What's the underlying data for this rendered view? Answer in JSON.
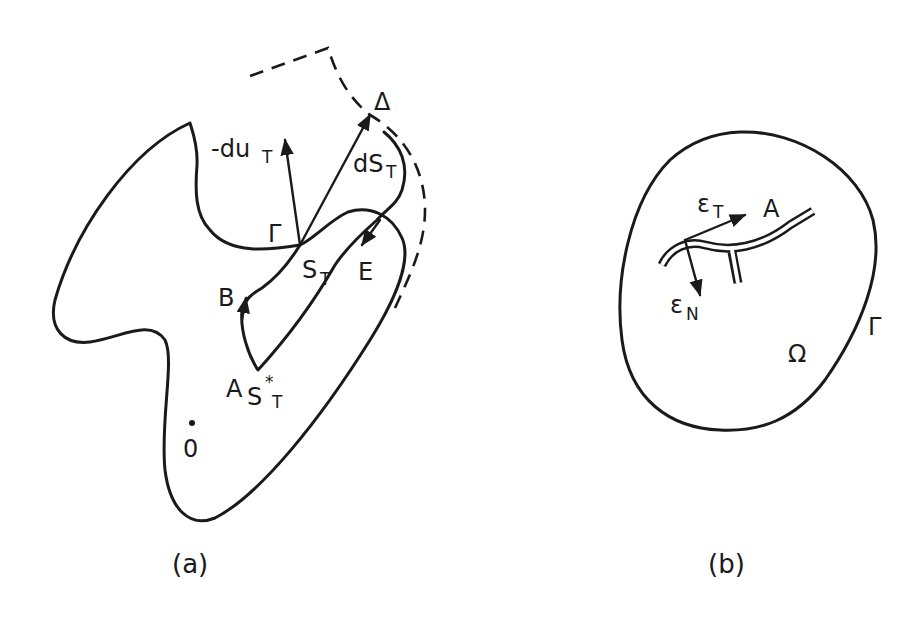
{
  "figure": {
    "panel_a": {
      "caption": "(a)",
      "labels": {
        "neg_du": "-du",
        "neg_du_sub": "T",
        "ds": "dS",
        "ds_sub": "T",
        "delta": "Δ",
        "gamma": "Γ",
        "s": "S",
        "s_sub": "T",
        "e": "E",
        "b": "B",
        "a": "A",
        "a_s": "S",
        "a_s_sub": "T",
        "a_s_sup": "*",
        "origin": "0"
      }
    },
    "panel_b": {
      "caption": "(b)",
      "labels": {
        "eps_t": "ε",
        "eps_t_sub": "T",
        "a": "A",
        "eps_n": "ε",
        "eps_n_sub": "N",
        "gamma": "Γ",
        "omega": "Ω"
      }
    },
    "colors": {
      "ink": "#1a1a1a",
      "paper": "#ffffff"
    }
  }
}
